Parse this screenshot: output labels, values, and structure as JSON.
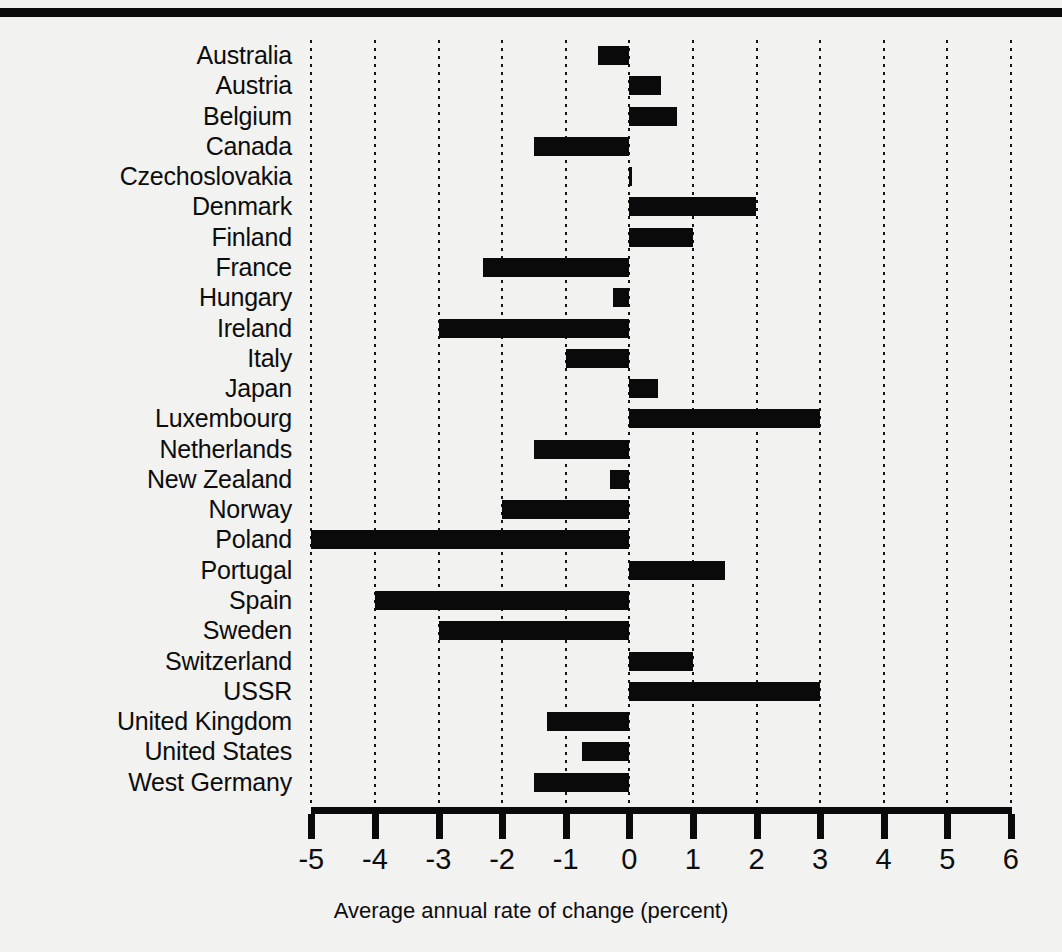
{
  "chart_data": {
    "type": "bar",
    "orientation": "horizontal",
    "title": "",
    "xlabel": "Average annual rate of change (percent)",
    "ylabel": "",
    "xlim": [
      -5,
      6
    ],
    "xticks": [
      -5,
      -4,
      -3,
      -2,
      -1,
      0,
      1,
      2,
      3,
      4,
      5,
      6
    ],
    "xticklabels": [
      "-5",
      "-4",
      "-3",
      "-2",
      "-1",
      "0",
      "1",
      "2",
      "3",
      "4",
      "5",
      "6"
    ],
    "grid": "vertical-dotted",
    "legend": null,
    "bar_color": "#0a0a0a",
    "background": "#f2f2f0",
    "categories": [
      "Australia",
      "Austria",
      "Belgium",
      "Canada",
      "Czechoslovakia",
      "Denmark",
      "Finland",
      "France",
      "Hungary",
      "Ireland",
      "Italy",
      "Japan",
      "Luxembourg",
      "Netherlands",
      "New Zealand",
      "Norway",
      "Poland",
      "Portugal",
      "Spain",
      "Sweden",
      "Switzerland",
      "USSR",
      "United Kingdom",
      "United States",
      "West Germany"
    ],
    "values": [
      -0.5,
      0.5,
      0.75,
      -1.5,
      0.0,
      2.0,
      1.0,
      -2.3,
      -0.25,
      -3.0,
      -1.0,
      0.45,
      3.0,
      -1.5,
      -0.3,
      -2.0,
      -5.0,
      1.5,
      -4.0,
      -3.0,
      1.0,
      3.0,
      -1.3,
      -0.75,
      -1.5
    ]
  }
}
